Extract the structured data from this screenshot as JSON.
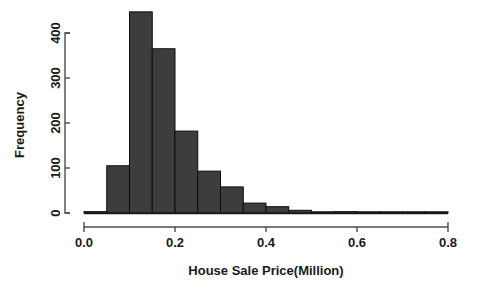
{
  "chart_data": {
    "type": "bar",
    "title": "",
    "subtitle": "",
    "xlabel": "House Sale Price(Million)",
    "ylabel": "Frequency",
    "xlim": [
      0.0,
      0.8
    ],
    "ylim": [
      0,
      450
    ],
    "grid": false,
    "legend": "none",
    "bin_width": 0.05,
    "bar_color": "#3d3d3d",
    "bar_edge_color": "#0d0d0d",
    "axis_color": "#4d4d4d",
    "xtick_labels": [
      "0.0",
      "0.2",
      "0.4",
      "0.6",
      "0.8"
    ],
    "xtick_values": [
      0.0,
      0.2,
      0.4,
      0.6,
      0.8
    ],
    "ytick_labels": [
      "0",
      "100",
      "200",
      "300",
      "400"
    ],
    "ytick_values": [
      0,
      100,
      200,
      300,
      400
    ],
    "bin_edges": [
      0.0,
      0.05,
      0.1,
      0.15,
      0.2,
      0.25,
      0.3,
      0.35,
      0.4,
      0.45,
      0.5,
      0.55,
      0.6,
      0.65,
      0.7,
      0.75,
      0.8
    ],
    "categories": [
      "0.00-0.05",
      "0.05-0.10",
      "0.10-0.15",
      "0.15-0.20",
      "0.20-0.25",
      "0.25-0.30",
      "0.30-0.35",
      "0.35-0.40",
      "0.40-0.45",
      "0.45-0.50",
      "0.50-0.55",
      "0.55-0.60",
      "0.60-0.65",
      "0.65-0.70",
      "0.70-0.75",
      "0.75-0.80"
    ],
    "values": [
      3,
      105,
      447,
      365,
      182,
      93,
      58,
      22,
      14,
      6,
      2,
      3,
      2,
      1,
      1,
      1
    ]
  }
}
